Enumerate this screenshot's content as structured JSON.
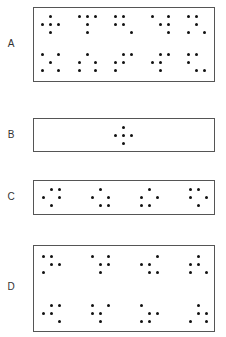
{
  "colors": {
    "dot": "#111111",
    "border": "#555555",
    "label": "#333333",
    "background": "#ffffff"
  },
  "grid_step": 8,
  "panels": [
    {
      "label": "A",
      "label_pos": [
        5,
        38
      ],
      "box": [
        33,
        7,
        182,
        75
      ],
      "patterns": [
        {
          "origin": [
            42,
            16
          ],
          "dots": [
            [
              1,
              0
            ],
            [
              0,
              1
            ],
            [
              1,
              1
            ],
            [
              2,
              1
            ],
            [
              1,
              2
            ]
          ]
        },
        {
          "origin": [
            79,
            16
          ],
          "dots": [
            [
              0,
              0
            ],
            [
              1,
              0
            ],
            [
              2,
              0
            ],
            [
              1,
              1
            ],
            [
              1,
              2
            ]
          ]
        },
        {
          "origin": [
            115,
            16
          ],
          "dots": [
            [
              0,
              0
            ],
            [
              1,
              0
            ],
            [
              0,
              1
            ],
            [
              1,
              1
            ],
            [
              2,
              2
            ]
          ]
        },
        {
          "origin": [
            152,
            16
          ],
          "dots": [
            [
              0,
              0
            ],
            [
              2,
              0
            ],
            [
              1,
              1
            ],
            [
              2,
              1
            ],
            [
              2,
              2
            ]
          ]
        },
        {
          "origin": [
            188,
            16
          ],
          "dots": [
            [
              0,
              0
            ],
            [
              1,
              0
            ],
            [
              1,
              1
            ],
            [
              0,
              2
            ],
            [
              2,
              2
            ]
          ]
        },
        {
          "origin": [
            42,
            54
          ],
          "dots": [
            [
              0,
              0
            ],
            [
              2,
              0
            ],
            [
              1,
              1
            ],
            [
              0,
              2
            ],
            [
              2,
              2
            ]
          ]
        },
        {
          "origin": [
            79,
            54
          ],
          "dots": [
            [
              1,
              0
            ],
            [
              0,
              1
            ],
            [
              2,
              1
            ],
            [
              0,
              2
            ],
            [
              2,
              2
            ]
          ]
        },
        {
          "origin": [
            115,
            54
          ],
          "dots": [
            [
              1,
              0
            ],
            [
              2,
              0
            ],
            [
              0,
              1
            ],
            [
              1,
              1
            ],
            [
              0,
              2
            ]
          ]
        },
        {
          "origin": [
            152,
            54
          ],
          "dots": [
            [
              1,
              0
            ],
            [
              2,
              0
            ],
            [
              0,
              1
            ],
            [
              1,
              1
            ],
            [
              1,
              2
            ]
          ]
        },
        {
          "origin": [
            188,
            54
          ],
          "dots": [
            [
              0,
              0
            ],
            [
              1,
              0
            ],
            [
              0,
              1
            ],
            [
              1,
              2
            ],
            [
              2,
              2
            ]
          ]
        }
      ]
    },
    {
      "label": "B",
      "label_pos": [
        5,
        129
      ],
      "box": [
        33,
        118,
        182,
        34
      ],
      "patterns": [
        {
          "origin": [
            115,
            127
          ],
          "dots": [
            [
              1,
              0
            ],
            [
              0,
              1
            ],
            [
              1,
              1
            ],
            [
              2,
              1
            ],
            [
              1,
              2
            ]
          ]
        }
      ]
    },
    {
      "label": "C",
      "label_pos": [
        5,
        191
      ],
      "box": [
        33,
        180,
        182,
        35
      ],
      "patterns": [
        {
          "origin": [
            43,
            189
          ],
          "dots": [
            [
              1,
              0
            ],
            [
              2,
              0
            ],
            [
              0,
              1
            ],
            [
              2,
              1
            ],
            [
              1,
              2
            ]
          ]
        },
        {
          "origin": [
            92,
            189
          ],
          "dots": [
            [
              1,
              0
            ],
            [
              0,
              1
            ],
            [
              2,
              1
            ],
            [
              1,
              2
            ],
            [
              2,
              2
            ]
          ]
        },
        {
          "origin": [
            141,
            189
          ],
          "dots": [
            [
              1,
              0
            ],
            [
              0,
              1
            ],
            [
              2,
              1
            ],
            [
              0,
              2
            ],
            [
              1,
              2
            ]
          ]
        },
        {
          "origin": [
            190,
            189
          ],
          "dots": [
            [
              0,
              0
            ],
            [
              1,
              0
            ],
            [
              0,
              1
            ],
            [
              2,
              1
            ],
            [
              1,
              2
            ]
          ]
        }
      ]
    },
    {
      "label": "D",
      "label_pos": [
        5,
        281
      ],
      "box": [
        33,
        245,
        182,
        87
      ],
      "patterns": [
        {
          "origin": [
            43,
            256
          ],
          "dots": [
            [
              0,
              0
            ],
            [
              1,
              0
            ],
            [
              1,
              1
            ],
            [
              2,
              1
            ],
            [
              0,
              2
            ]
          ]
        },
        {
          "origin": [
            92,
            256
          ],
          "dots": [
            [
              0,
              0
            ],
            [
              2,
              0
            ],
            [
              1,
              1
            ],
            [
              2,
              1
            ],
            [
              1,
              2
            ]
          ]
        },
        {
          "origin": [
            141,
            256
          ],
          "dots": [
            [
              2,
              0
            ],
            [
              0,
              1
            ],
            [
              1,
              1
            ],
            [
              1,
              2
            ],
            [
              2,
              2
            ]
          ]
        },
        {
          "origin": [
            190,
            256
          ],
          "dots": [
            [
              1,
              0
            ],
            [
              0,
              1
            ],
            [
              1,
              1
            ],
            [
              0,
              2
            ],
            [
              2,
              2
            ]
          ]
        },
        {
          "origin": [
            43,
            305
          ],
          "dots": [
            [
              1,
              0
            ],
            [
              2,
              0
            ],
            [
              0,
              1
            ],
            [
              1,
              1
            ],
            [
              2,
              2
            ]
          ]
        },
        {
          "origin": [
            92,
            305
          ],
          "dots": [
            [
              0,
              0
            ],
            [
              2,
              0
            ],
            [
              0,
              1
            ],
            [
              1,
              1
            ],
            [
              1,
              2
            ]
          ]
        },
        {
          "origin": [
            141,
            305
          ],
          "dots": [
            [
              0,
              0
            ],
            [
              1,
              1
            ],
            [
              2,
              1
            ],
            [
              0,
              2
            ],
            [
              1,
              2
            ]
          ]
        },
        {
          "origin": [
            190,
            305
          ],
          "dots": [
            [
              1,
              0
            ],
            [
              1,
              1
            ],
            [
              2,
              1
            ],
            [
              0,
              2
            ],
            [
              2,
              2
            ]
          ]
        }
      ]
    }
  ]
}
